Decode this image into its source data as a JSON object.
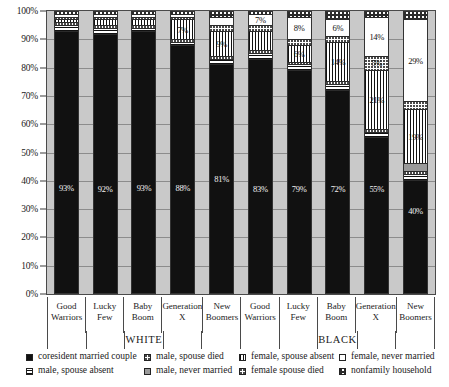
{
  "chart_data": {
    "type": "bar",
    "subtype": "stacked-100-percent",
    "title": "",
    "xlabel": "",
    "ylabel": "",
    "ylim": [
      0,
      100
    ],
    "ytick_labels": [
      "100%",
      "90%",
      "80%",
      "70%",
      "60%",
      "50%",
      "40%",
      "30%",
      "20%",
      "10%",
      "0%"
    ],
    "ytick_values": [
      100,
      90,
      80,
      70,
      60,
      50,
      40,
      30,
      20,
      10,
      0
    ],
    "grid": true,
    "legend_position": "bottom",
    "groups": [
      "WHITE",
      "BLACK"
    ],
    "categories": [
      "Good Warriors",
      "Lucky Few",
      "Baby Boom",
      "Generation X",
      "New Boomers",
      "Good Warriors",
      "Lucky Few",
      "Baby Boom",
      "Generation X",
      "New Boomers"
    ],
    "series": [
      {
        "name": "coresident married couple",
        "pattern": "solid-dark",
        "values": [
          93,
          92,
          93,
          88,
          81,
          83,
          79,
          72,
          55,
          40
        ]
      },
      {
        "name": "male, spouse absent",
        "pattern": "horizontal-stripe",
        "values": [
          2,
          2,
          1,
          1,
          2,
          2,
          2,
          2,
          2,
          2
        ]
      },
      {
        "name": "male, spouse died",
        "pattern": "dots",
        "values": [
          1,
          1,
          1,
          1,
          1,
          1,
          1,
          1,
          1,
          1
        ]
      },
      {
        "name": "male, never married",
        "pattern": "gray",
        "values": [
          0,
          0,
          0,
          0,
          0,
          0,
          0,
          0,
          0,
          3
        ]
      },
      {
        "name": "female, spouse absent",
        "pattern": "vertical-stripe-fine",
        "values": [
          1,
          2,
          2,
          7,
          9,
          7,
          6,
          14,
          21,
          19
        ]
      },
      {
        "name": "female spouse died",
        "pattern": "dots-light",
        "values": [
          1,
          1,
          1,
          1,
          2,
          2,
          2,
          2,
          5,
          3
        ]
      },
      {
        "name": "female, never married",
        "pattern": "white",
        "values": [
          1,
          1,
          1,
          1,
          3,
          4,
          8,
          6,
          14,
          29
        ]
      },
      {
        "name": "nonfamily household",
        "pattern": "checker",
        "values": [
          1,
          1,
          1,
          1,
          2,
          1,
          2,
          3,
          2,
          3
        ]
      }
    ],
    "visible_value_labels": {
      "coresident married couple": [
        "93%",
        "92%",
        "93%",
        "88%",
        "81%",
        "83%",
        "79%",
        "72%",
        "55%",
        "40%"
      ],
      "female, spouse absent": [
        "",
        "",
        "",
        "7%",
        "9%",
        "",
        "6%",
        "14%",
        "21%",
        "19%"
      ],
      "female spouse died": [
        "",
        "",
        "",
        "",
        "",
        "",
        "",
        "",
        "5%",
        ""
      ],
      "female, never married": [
        "",
        "",
        "",
        "",
        "",
        "7%",
        "8%",
        "6%",
        "14%",
        "29%"
      ]
    }
  },
  "axis": {
    "yticks": [
      "100%",
      "90%",
      "80%",
      "70%",
      "60%",
      "50%",
      "40%",
      "30%",
      "20%",
      "10%",
      "0%"
    ]
  },
  "xaxis": {
    "cells": [
      {
        "line1": "Good",
        "line2": "Warriors"
      },
      {
        "line1": "Lucky Few",
        "line2": ""
      },
      {
        "line1": "Baby",
        "line2": "Boom"
      },
      {
        "line1": "Generation",
        "line2": "X"
      },
      {
        "line1": "New",
        "line2": "Boomers"
      },
      {
        "line1": "Good",
        "line2": "Warriors"
      },
      {
        "line1": "Lucky Few",
        "line2": ""
      },
      {
        "line1": "Baby",
        "line2": "Boom"
      },
      {
        "line1": "Generation",
        "line2": "X"
      },
      {
        "line1": "New",
        "line2": "Boomers"
      }
    ],
    "groups": [
      {
        "label": ""
      },
      {
        "label": ""
      },
      {
        "label": "WHITE"
      },
      {
        "label": ""
      },
      {
        "label": ""
      },
      {
        "label": ""
      },
      {
        "label": ""
      },
      {
        "label": "BLACK"
      },
      {
        "label": ""
      },
      {
        "label": ""
      }
    ]
  },
  "legend": {
    "items": [
      {
        "label": "coresident married couple",
        "pattern": "solid-dark"
      },
      {
        "label": "male, spouse absent",
        "pattern": "horizontal-stripe"
      },
      {
        "label": "male, spouse died",
        "pattern": "dots"
      },
      {
        "label": "male, never married",
        "pattern": "gray"
      },
      {
        "label": "female, spouse absent",
        "pattern": "vertical-stripe-fine"
      },
      {
        "label": "female spouse died",
        "pattern": "dots-light"
      },
      {
        "label": "female, never married",
        "pattern": "white"
      },
      {
        "label": "nonfamily household",
        "pattern": "checker"
      }
    ]
  },
  "colors": {
    "plot_background": "#c9c9c9",
    "gridline": "#8c8c8c",
    "axis": "#3a3a3a",
    "series_dark": "#111111",
    "series_gray": "#9a9a9a",
    "series_white": "#ffffff"
  }
}
